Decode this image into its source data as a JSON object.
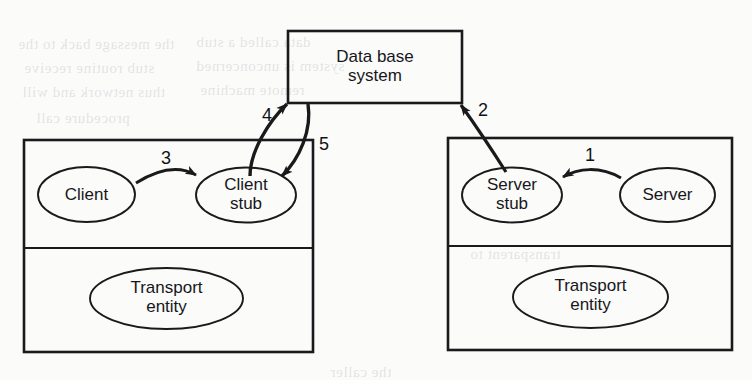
{
  "diagram": {
    "background_color": "#fbfbfa",
    "ink_color": "#1a1a1c",
    "boxes": {
      "database": {
        "label": "Data base\nsystem",
        "name": "data-base-system"
      },
      "client_machine": {
        "name": "client-machine"
      },
      "server_machine": {
        "name": "server-machine"
      }
    },
    "nodes": {
      "client": "Client",
      "client_stub": "Client\nstub",
      "client_transport": "Transport\nentity",
      "server_stub": "Server\nstub",
      "server": "Server",
      "server_transport": "Transport\nentity"
    },
    "arrows": [
      {
        "id": "1",
        "label": "1",
        "from": "server",
        "to": "server_stub",
        "direction": "left"
      },
      {
        "id": "2",
        "label": "2",
        "from": "server_stub",
        "to": "database",
        "direction": "up"
      },
      {
        "id": "3",
        "label": "3",
        "from": "client",
        "to": "client_stub",
        "direction": "right"
      },
      {
        "id": "4",
        "label": "4",
        "from": "client_stub",
        "to": "database",
        "direction": "up"
      },
      {
        "id": "5",
        "label": "5",
        "from": "database",
        "to": "client_stub",
        "direction": "down"
      }
    ],
    "ghost_text": [
      "the message back to the",
      "data called a stub",
      "stub routine receive",
      "system is unconcerned",
      "thus network and will",
      "remote machine",
      "procedure call",
      "transparent to",
      "the caller"
    ]
  }
}
